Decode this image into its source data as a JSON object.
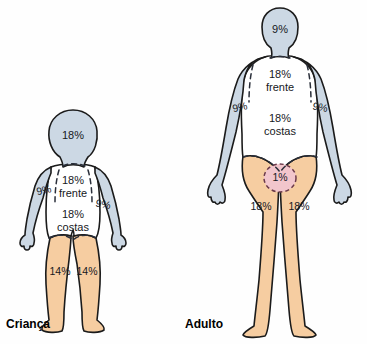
{
  "diagram": {
    "title_visible": false,
    "background_color": "#fefefe",
    "colors": {
      "skin_lower": "#f6cda1",
      "upper_blue_gray": "#ccd8e4",
      "torso_white": "#ffffff",
      "genital_pink": "#f2c6cc",
      "outline": "#1b1b1b",
      "text": "#16181c",
      "dashed_divider": "#2a2f3a",
      "genital_dash": "#6b3a4a"
    }
  },
  "figures": [
    {
      "id": "child",
      "caption": "Criança",
      "regions": {
        "head": "18%",
        "torso_front": "18%",
        "torso_front_label": "frente",
        "torso_back": "18%",
        "torso_back_label": "costas",
        "arm_left": "9%",
        "arm_right": "9%",
        "leg_left": "14%",
        "leg_right": "14%"
      }
    },
    {
      "id": "adult",
      "caption": "Adulto",
      "regions": {
        "head": "9%",
        "torso_front": "18%",
        "torso_front_label": "frente",
        "torso_back": "18%",
        "torso_back_label": "costas",
        "arm_left": "9%",
        "arm_right": "9%",
        "leg_left": "18%",
        "leg_right": "18%",
        "genital": "1%"
      }
    }
  ]
}
